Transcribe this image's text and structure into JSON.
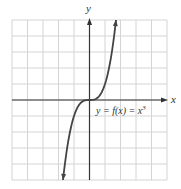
{
  "chart_data": {
    "type": "line",
    "title": "",
    "xlabel": "x",
    "ylabel": "y",
    "annotation": "y = f(x) = x^3",
    "annotation_parts": {
      "base": "y = f(x) = x",
      "exp": "3"
    },
    "xlim": [
      -5,
      5
    ],
    "ylim": [
      -5,
      5
    ],
    "grid": true,
    "legend": null,
    "series": [
      {
        "name": "f(x) = x^3",
        "x": [
          -1.71,
          -1.5,
          -1.25,
          -1.0,
          -0.75,
          -0.5,
          -0.25,
          0,
          0.25,
          0.5,
          0.75,
          1.0,
          1.25,
          1.5,
          1.71
        ],
        "y": [
          -5.0,
          -3.375,
          -1.953,
          -1.0,
          -0.422,
          -0.125,
          -0.016,
          0,
          0.016,
          0.125,
          0.422,
          1.0,
          1.953,
          3.375,
          5.0
        ]
      }
    ]
  },
  "colors": {
    "grid": "#d4d4d4",
    "axis": "#333333",
    "curve": "#444444",
    "background": "#ffffff"
  }
}
